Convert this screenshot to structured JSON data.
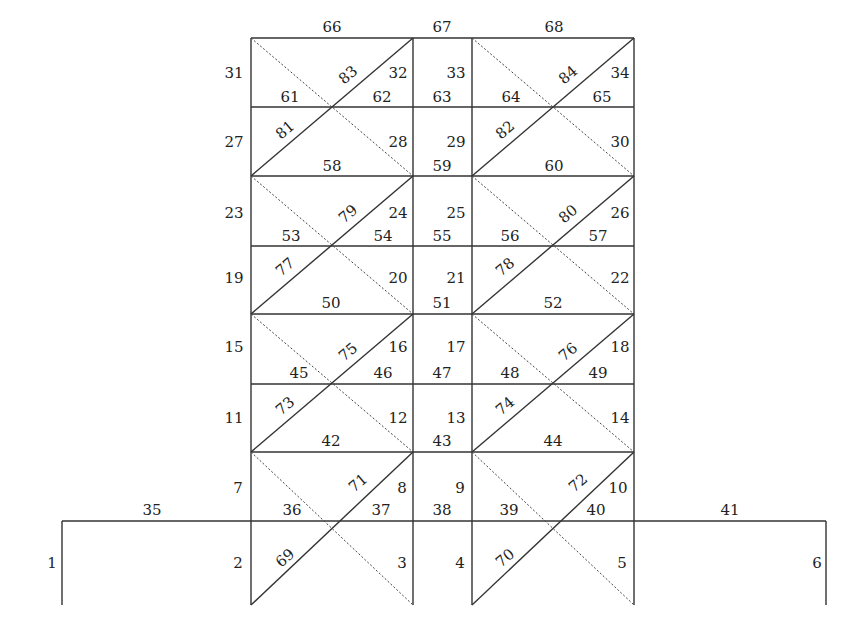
{
  "diagram": {
    "type": "structural-frame-member-numbering",
    "geometry": {
      "columns_x": [
        251,
        413,
        472,
        634
      ],
      "outer_x": [
        62,
        826
      ],
      "levels_y": [
        38,
        107,
        176,
        246,
        314,
        384,
        452,
        521
      ],
      "base_y": 605
    },
    "labels": {
      "base_columns": [
        {
          "id": "1",
          "x": 52,
          "y": 568
        },
        {
          "id": "2",
          "x": 238,
          "y": 568
        },
        {
          "id": "3",
          "x": 402,
          "y": 568
        },
        {
          "id": "4",
          "x": 460,
          "y": 568
        },
        {
          "id": "5",
          "x": 622,
          "y": 568
        },
        {
          "id": "6",
          "x": 817,
          "y": 568
        }
      ],
      "columns": [
        {
          "id": "7",
          "x": 238,
          "y": 493
        },
        {
          "id": "8",
          "x": 402,
          "y": 493
        },
        {
          "id": "9",
          "x": 460,
          "y": 493
        },
        {
          "id": "10",
          "x": 618,
          "y": 493
        },
        {
          "id": "11",
          "x": 234,
          "y": 423
        },
        {
          "id": "12",
          "x": 398,
          "y": 423
        },
        {
          "id": "13",
          "x": 456,
          "y": 423
        },
        {
          "id": "14",
          "x": 620,
          "y": 423
        },
        {
          "id": "15",
          "x": 234,
          "y": 352
        },
        {
          "id": "16",
          "x": 398,
          "y": 352
        },
        {
          "id": "17",
          "x": 456,
          "y": 352
        },
        {
          "id": "18",
          "x": 620,
          "y": 352
        },
        {
          "id": "19",
          "x": 234,
          "y": 283
        },
        {
          "id": "20",
          "x": 398,
          "y": 283
        },
        {
          "id": "21",
          "x": 456,
          "y": 283
        },
        {
          "id": "22",
          "x": 620,
          "y": 283
        },
        {
          "id": "23",
          "x": 234,
          "y": 218
        },
        {
          "id": "24",
          "x": 398,
          "y": 218
        },
        {
          "id": "25",
          "x": 456,
          "y": 218
        },
        {
          "id": "26",
          "x": 620,
          "y": 218
        },
        {
          "id": "27",
          "x": 234,
          "y": 147
        },
        {
          "id": "28",
          "x": 398,
          "y": 147
        },
        {
          "id": "29",
          "x": 456,
          "y": 147
        },
        {
          "id": "30",
          "x": 620,
          "y": 147
        },
        {
          "id": "31",
          "x": 234,
          "y": 78
        },
        {
          "id": "32",
          "x": 398,
          "y": 78
        },
        {
          "id": "33",
          "x": 456,
          "y": 78
        },
        {
          "id": "34",
          "x": 620,
          "y": 78
        }
      ],
      "beams": [
        {
          "id": "35",
          "x": 152,
          "y": 515
        },
        {
          "id": "36",
          "x": 292,
          "y": 515
        },
        {
          "id": "37",
          "x": 381,
          "y": 515
        },
        {
          "id": "38",
          "x": 442,
          "y": 515
        },
        {
          "id": "39",
          "x": 509,
          "y": 515
        },
        {
          "id": "40",
          "x": 596,
          "y": 515
        },
        {
          "id": "41",
          "x": 730,
          "y": 515
        },
        {
          "id": "42",
          "x": 331,
          "y": 446
        },
        {
          "id": "43",
          "x": 442,
          "y": 446
        },
        {
          "id": "44",
          "x": 553,
          "y": 446
        },
        {
          "id": "45",
          "x": 299,
          "y": 378
        },
        {
          "id": "46",
          "x": 383,
          "y": 378
        },
        {
          "id": "47",
          "x": 442,
          "y": 378
        },
        {
          "id": "48",
          "x": 510,
          "y": 378
        },
        {
          "id": "49",
          "x": 598,
          "y": 378
        },
        {
          "id": "50",
          "x": 331,
          "y": 308
        },
        {
          "id": "51",
          "x": 442,
          "y": 308
        },
        {
          "id": "52",
          "x": 553,
          "y": 308
        },
        {
          "id": "53",
          "x": 291,
          "y": 241
        },
        {
          "id": "54",
          "x": 383,
          "y": 241
        },
        {
          "id": "55",
          "x": 442,
          "y": 241
        },
        {
          "id": "56",
          "x": 510,
          "y": 241
        },
        {
          "id": "57",
          "x": 598,
          "y": 241
        },
        {
          "id": "58",
          "x": 332,
          "y": 171
        },
        {
          "id": "59",
          "x": 442,
          "y": 171
        },
        {
          "id": "60",
          "x": 554,
          "y": 171
        },
        {
          "id": "61",
          "x": 290,
          "y": 102
        },
        {
          "id": "62",
          "x": 382,
          "y": 102
        },
        {
          "id": "63",
          "x": 442,
          "y": 102
        },
        {
          "id": "64",
          "x": 511,
          "y": 102
        },
        {
          "id": "65",
          "x": 602,
          "y": 102
        },
        {
          "id": "66",
          "x": 332,
          "y": 32
        },
        {
          "id": "67",
          "x": 442,
          "y": 32
        },
        {
          "id": "68",
          "x": 554,
          "y": 32
        }
      ],
      "braces": [
        {
          "id": "69",
          "x": 285,
          "y": 563
        },
        {
          "id": "70",
          "x": 505,
          "y": 563
        },
        {
          "id": "71",
          "x": 358,
          "y": 488
        },
        {
          "id": "72",
          "x": 578,
          "y": 488
        },
        {
          "id": "73",
          "x": 285,
          "y": 411
        },
        {
          "id": "74",
          "x": 505,
          "y": 411
        },
        {
          "id": "75",
          "x": 348,
          "y": 357
        },
        {
          "id": "76",
          "x": 568,
          "y": 357
        },
        {
          "id": "77",
          "x": 285,
          "y": 272
        },
        {
          "id": "78",
          "x": 505,
          "y": 272
        },
        {
          "id": "79",
          "x": 348,
          "y": 219
        },
        {
          "id": "80",
          "x": 568,
          "y": 219
        },
        {
          "id": "81",
          "x": 285,
          "y": 135
        },
        {
          "id": "82",
          "x": 505,
          "y": 135
        },
        {
          "id": "83",
          "x": 348,
          "y": 80
        },
        {
          "id": "84",
          "x": 568,
          "y": 80
        }
      ]
    }
  }
}
